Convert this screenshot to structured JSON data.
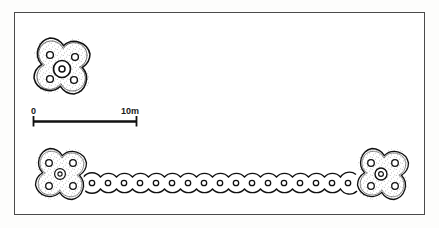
{
  "figure": {
    "kind": "archaeological-site-plan",
    "border_color": "#4a4a4a",
    "ink_color": "#111111",
    "fill_color": "#ffffff",
    "stipple_color": "#555555"
  },
  "scale_bar": {
    "name": "scale-bar",
    "start_label": "0",
    "end_label": "10m",
    "unit": "m",
    "length_value": 10,
    "bar_x_start_px": 33,
    "bar_x_end_px": 137,
    "bar_y_px": 121
  },
  "structures": [
    {
      "id": "upper-quatrefoil",
      "name": "Small quatrefoil structure",
      "center": {
        "x": 62,
        "y": 66
      },
      "lobe_radius": 16,
      "lobe_offset": 12,
      "post_holes": [
        {
          "x": 50,
          "y": 55,
          "r": 3.4
        },
        {
          "x": 75,
          "y": 57,
          "r": 3.4
        },
        {
          "x": 50,
          "y": 79,
          "r": 3.4
        },
        {
          "x": 74,
          "y": 80,
          "r": 3.4
        }
      ],
      "central_feature": {
        "x": 62,
        "y": 69,
        "outer_r": 8.5,
        "inner_r": 3.0
      },
      "stippled": true
    },
    {
      "id": "left-end-quatrefoil",
      "name": "Left terminal quatrefoil",
      "center": {
        "x": 61,
        "y": 173
      },
      "lobe_radius": 15,
      "lobe_offset": 12,
      "post_holes": [
        {
          "x": 49,
          "y": 162,
          "r": 3.2
        },
        {
          "x": 73,
          "y": 163,
          "r": 3.2
        },
        {
          "x": 49,
          "y": 185,
          "r": 3.2
        },
        {
          "x": 73,
          "y": 186,
          "r": 3.2
        }
      ],
      "central_feature": {
        "x": 60,
        "y": 174,
        "outer_r": 5.5,
        "inner_r": 2.2
      },
      "stippled": true
    },
    {
      "id": "post-hole-chain",
      "name": "Linear chain of circular post settings",
      "count": 17,
      "y": 183,
      "x_start": 90,
      "x_end": 352,
      "circle_radius": 10.5,
      "hole_radius": 2.6,
      "stippled": false
    },
    {
      "id": "right-end-quatrefoil",
      "name": "Right terminal quatrefoil",
      "center": {
        "x": 383,
        "y": 174
      },
      "lobe_radius": 15,
      "lobe_offset": 12,
      "post_holes": [
        {
          "x": 371,
          "y": 163,
          "r": 3.2
        },
        {
          "x": 395,
          "y": 163,
          "r": 3.2
        },
        {
          "x": 371,
          "y": 186,
          "r": 3.2
        },
        {
          "x": 395,
          "y": 186,
          "r": 3.2
        }
      ],
      "central_feature": {
        "x": 381,
        "y": 174,
        "outer_r": 6.0,
        "inner_r": 2.4
      },
      "stippled": true
    }
  ]
}
